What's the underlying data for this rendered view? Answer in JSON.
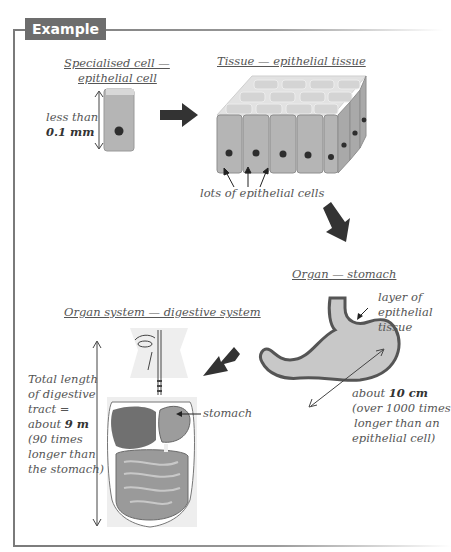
{
  "header": {
    "badge_label": "Example"
  },
  "cell": {
    "title_line1": "Specialised cell —",
    "title_line2": "epithelial cell",
    "size_prefix": "less than",
    "size_value": "0.1 mm"
  },
  "tissue": {
    "title": "Tissue — epithelial tissue",
    "caption": "lots of epithelial cells"
  },
  "organ": {
    "title": "Organ — stomach",
    "layer_line1": "layer of",
    "layer_line2": "epithelial",
    "layer_line3": "tissue",
    "size_prefix": "about ",
    "size_value": "10 cm",
    "size_line2": "(over 1000 times",
    "size_line3": "longer than an",
    "size_line4": "epithelial cell)"
  },
  "organ_system": {
    "title": "Organ system — digestive system",
    "length_line1": "Total length",
    "length_line2": "of digestive",
    "length_line3": "tract =",
    "length_prefix": "about ",
    "length_value": "9 m",
    "length_line5": "(90 times",
    "length_line6": "longer than",
    "length_line7": "the stomach)",
    "stomach_label": "stomach"
  },
  "colors": {
    "frame": "#7a7a7a",
    "badge_bg": "#6d6d6d",
    "cell_fill": "#b8b8b8",
    "cell_top": "#dcdcdc",
    "nucleus": "#2e2e2e",
    "arrow": "#333333",
    "stomach_fill": "#c8c8c8",
    "stomach_outline": "#555555"
  }
}
